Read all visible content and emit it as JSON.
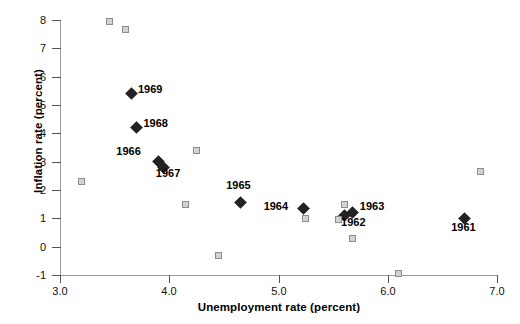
{
  "chart_data": {
    "type": "scatter",
    "title": "",
    "xlabel": "Unemployment rate (percent)",
    "ylabel": "Inflation rate (percent)",
    "xlim": [
      3.0,
      7.0
    ],
    "ylim": [
      -1,
      8
    ],
    "xticks": [
      "3.0",
      "4.0",
      "5.0",
      "6.0",
      "7.0"
    ],
    "xtick_values": [
      3.0,
      4.0,
      5.0,
      6.0,
      7.0
    ],
    "yticks": [
      "8",
      "7",
      "6",
      "5",
      "4",
      "3",
      "2",
      "1",
      "0",
      "-1"
    ],
    "ytick_values": [
      8,
      7,
      6,
      5,
      4,
      3,
      2,
      1,
      0,
      -1
    ],
    "grid": false,
    "legend": "none",
    "series": [
      {
        "name": "labeled-years",
        "marker": "diamond",
        "color": "#222222",
        "points": [
          {
            "label": "1969",
            "x": 3.65,
            "y": 5.4,
            "label_dx": 7,
            "label_dy": -5
          },
          {
            "label": "1968",
            "x": 3.7,
            "y": 4.2,
            "label_dx": 7,
            "label_dy": -5
          },
          {
            "label": "1966",
            "x": 3.9,
            "y": 3.0,
            "label_dx": -42,
            "label_dy": -11
          },
          {
            "label": "1967",
            "x": 3.95,
            "y": 2.78,
            "label_dx": -8,
            "label_dy": 5
          },
          {
            "label": "1965",
            "x": 4.65,
            "y": 1.55,
            "label_dx": -14,
            "label_dy": -18
          },
          {
            "label": "1964",
            "x": 5.23,
            "y": 1.35,
            "label_dx": -40,
            "label_dy": -2
          },
          {
            "label": "1963",
            "x": 5.68,
            "y": 1.2,
            "label_dx": 7,
            "label_dy": -7
          },
          {
            "label": "1962",
            "x": 5.6,
            "y": 1.1,
            "label_dx": -3,
            "label_dy": 6
          },
          {
            "label": "1961",
            "x": 6.7,
            "y": 1.0,
            "label_dx": -13,
            "label_dy": 9
          }
        ]
      },
      {
        "name": "other-years",
        "marker": "square",
        "color": "#d2d2d2",
        "edgecolor": "#8c8c8c",
        "points": [
          {
            "x": 3.45,
            "y": 7.95
          },
          {
            "x": 3.6,
            "y": 7.65
          },
          {
            "x": 3.2,
            "y": 2.3
          },
          {
            "x": 4.25,
            "y": 3.4
          },
          {
            "x": 4.15,
            "y": 1.5
          },
          {
            "x": 4.45,
            "y": -0.3
          },
          {
            "x": 5.25,
            "y": 1.0
          },
          {
            "x": 5.6,
            "y": 1.5
          },
          {
            "x": 5.55,
            "y": 0.95
          },
          {
            "x": 5.68,
            "y": 0.3
          },
          {
            "x": 6.1,
            "y": -0.95
          },
          {
            "x": 6.85,
            "y": 2.65
          }
        ]
      }
    ]
  }
}
